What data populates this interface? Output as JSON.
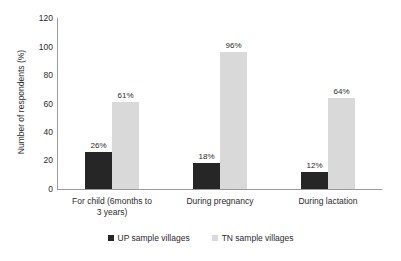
{
  "chart_data": {
    "type": "bar",
    "title": "",
    "xlabel": "",
    "ylabel": "Number of respondents (%)",
    "ylim": [
      0,
      120
    ],
    "yticks": [
      0,
      20,
      40,
      60,
      80,
      100,
      120
    ],
    "grid": false,
    "legend_position": "bottom",
    "categories": [
      "For child (6months to 3 years)",
      "During pregnancy",
      "During lactation"
    ],
    "series": [
      {
        "name": "UP sample villages",
        "color": "#262626",
        "values": [
          26,
          18,
          12
        ],
        "labels": [
          "26%",
          "18%",
          "12%"
        ]
      },
      {
        "name": "TN sample villages",
        "color": "#d9d9d9",
        "values": [
          61,
          96,
          64
        ],
        "labels": [
          "61%",
          "96%",
          "64%"
        ]
      }
    ]
  },
  "axis": {
    "y_title": "Number of respondents (%)",
    "y_tick_labels": [
      "120",
      "100",
      "80",
      "60",
      "40",
      "20",
      "0"
    ]
  },
  "categories": [
    {
      "label_line1": "For child (6months to",
      "label_line2": "3 years)"
    },
    {
      "label_line1": "During pregnancy",
      "label_line2": ""
    },
    {
      "label_line1": "During lactation",
      "label_line2": ""
    }
  ],
  "legend": {
    "items": [
      {
        "label": "UP sample villages"
      },
      {
        "label": "TN sample villages"
      }
    ]
  }
}
